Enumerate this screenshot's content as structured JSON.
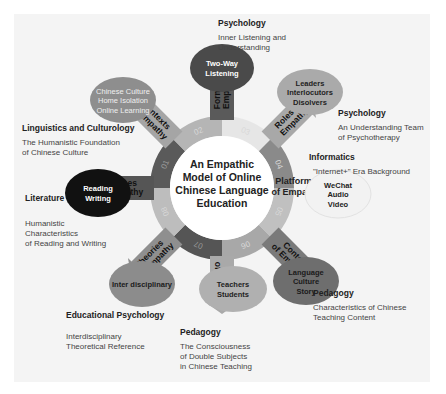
{
  "center": {
    "lines": [
      "An Empathic",
      "Model of Online",
      "Chinese Language",
      "Education"
    ]
  },
  "ring_segments": [
    {
      "number": "01",
      "color": "#5a5a5a"
    },
    {
      "number": "02",
      "color": "#b5b5b5"
    },
    {
      "number": "03",
      "color": "#e6e6e6"
    },
    {
      "number": "04",
      "color": "#8a8a8a"
    },
    {
      "number": "05",
      "color": "#c0c0c0"
    },
    {
      "number": "06",
      "color": "#a8a8a8"
    },
    {
      "number": "07",
      "color": "#555555"
    },
    {
      "number": "08",
      "color": "#bdbdbd"
    }
  ],
  "branches": [
    {
      "id": "forms",
      "arrow_label": [
        "Forms of",
        "Empathy"
      ],
      "bubble": [
        "Two-Way",
        "Listening"
      ],
      "bubble_color": "#4a4a4a",
      "bubble_text_color": "#ffffff",
      "discipline": "Psychology",
      "description": "Inner Listening and\nUnderstanding"
    },
    {
      "id": "roles",
      "arrow_label": [
        "Roles of",
        "Empathy"
      ],
      "bubble": [
        "Leaders",
        "Interlocutors",
        "Disolvers"
      ],
      "bubble_color": "#aaaaaa",
      "bubble_text_color": "#222222",
      "discipline": "Psychology",
      "description": "An Understanding Team\nof Psychotherapy"
    },
    {
      "id": "platforms",
      "arrow_label": [
        "Platforms",
        "of Empathy"
      ],
      "bubble": [
        "WeChat",
        "Audio",
        "Video"
      ],
      "bubble_color": "#f2f2f2",
      "bubble_text_color": "#222222",
      "discipline": "Informatics",
      "description": "\"Internet+\" Era Background"
    },
    {
      "id": "content",
      "arrow_label": [
        "Content",
        "of Empathy"
      ],
      "bubble": [
        "Language",
        "Culture",
        "Story"
      ],
      "bubble_color": "#6e6e6e",
      "bubble_text_color": "#1a1a1a",
      "discipline": "Pedagogy",
      "description": "Characteristics of Chinese\nTeaching Content"
    },
    {
      "id": "subjects",
      "arrow_label": [
        "Subjects",
        "of Empathy"
      ],
      "bubble": [
        "Teachers",
        "Students"
      ],
      "bubble_color": "#b0b0b0",
      "bubble_text_color": "#222222",
      "discipline": "Pedagogy",
      "description": "The Consciousness\nof Double Subjects\nin Chinese Teaching"
    },
    {
      "id": "theories",
      "arrow_label": [
        "Theories",
        "of Empathy"
      ],
      "bubble": [
        "Inter disciplinary"
      ],
      "bubble_color": "#8c8c8c",
      "bubble_text_color": "#1a1a1a",
      "discipline": "Educational Psychology",
      "description": "Interdisciplinary\nTheoretical Reference"
    },
    {
      "id": "courses",
      "arrow_label": [
        "Courses",
        "of Empathy"
      ],
      "bubble": [
        "Reading",
        "Writing"
      ],
      "bubble_color": "#111111",
      "bubble_text_color": "#ffffff",
      "discipline": "Literature",
      "description": "Humanistic\nCharacteristics\nof Reading and Writing"
    },
    {
      "id": "contexts",
      "arrow_label": [
        "Contexts",
        "of Empathy"
      ],
      "bubble": [
        "Chinese Culture",
        "Home Isolation",
        "Online Learning"
      ],
      "bubble_color": "#8e8e8e",
      "bubble_text_color": "#eeeeee",
      "discipline": "Linguistics and Culturology",
      "description": "The Humanistic Foundation\nof Chinese Culture"
    }
  ]
}
